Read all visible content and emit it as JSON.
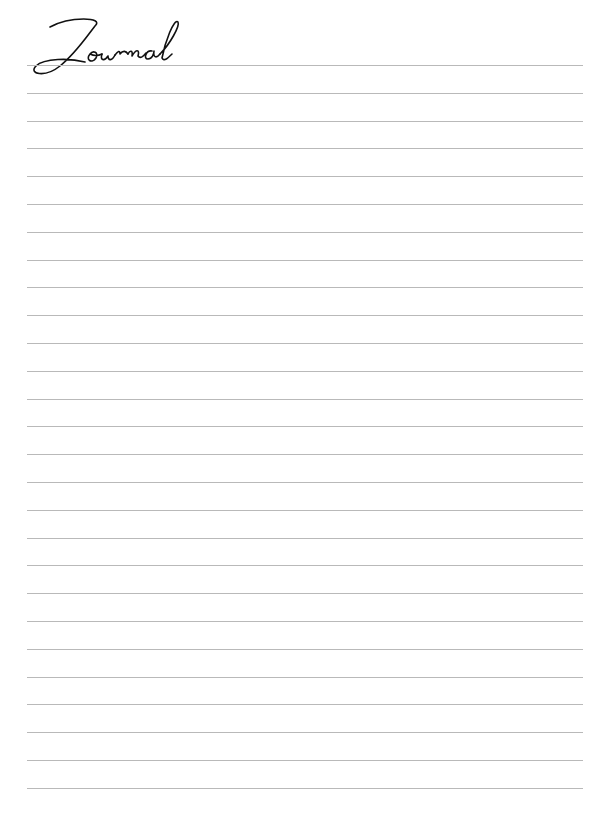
{
  "page": {
    "title": "Journal",
    "line_color": "#b9b9b9",
    "line_count": 27,
    "first_line_y": 65,
    "line_spacing": 27.8
  }
}
